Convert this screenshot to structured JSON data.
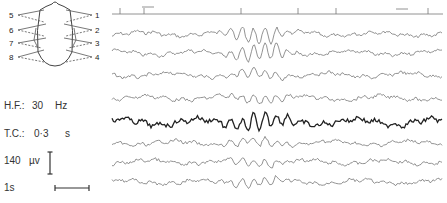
{
  "chart_data": {
    "type": "line",
    "title": "",
    "montage": {
      "electrode_labels_left": [
        "5",
        "6",
        "7",
        "8"
      ],
      "electrode_labels_right": [
        "1",
        "2",
        "3",
        "4"
      ]
    },
    "channels": [
      {
        "name": "marker",
        "baseline_y": 14
      },
      {
        "name": "1",
        "baseline_y": 34
      },
      {
        "name": "2",
        "baseline_y": 53
      },
      {
        "name": "3",
        "baseline_y": 75
      },
      {
        "name": "4",
        "baseline_y": 98
      },
      {
        "name": "5",
        "baseline_y": 122
      },
      {
        "name": "6",
        "baseline_y": 143
      },
      {
        "name": "7",
        "baseline_y": 162
      },
      {
        "name": "8",
        "baseline_y": 182
      }
    ],
    "burst_region_x": [
      215,
      300
    ],
    "settings": {
      "hf_label": "H.F.:",
      "hf_value": "30",
      "hf_unit": "Hz",
      "tc_label": "T.C.:",
      "tc_value": "0·3",
      "tc_unit": "s",
      "amplitude_value": "140",
      "amplitude_unit": "µv",
      "time_value": "1s"
    }
  },
  "labels": {
    "left": [
      "5",
      "6",
      "7",
      "8"
    ],
    "right": [
      "1",
      "2",
      "3",
      "4"
    ]
  },
  "params": {
    "hf_label": "H.F.:",
    "hf_value": "30",
    "hf_unit": "Hz",
    "tc_label": "T.C.:",
    "tc_value": "0·3",
    "tc_unit": "s",
    "amp_value": "140",
    "amp_unit": "µv",
    "time_label": "1s"
  }
}
